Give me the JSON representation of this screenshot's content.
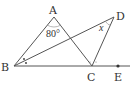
{
  "diagram": {
    "type": "geometry",
    "points": {
      "A": {
        "label": "A",
        "x": 54,
        "y": 17
      },
      "B": {
        "label": "B",
        "x": 14,
        "y": 66
      },
      "C": {
        "label": "C",
        "x": 92,
        "y": 66
      },
      "D": {
        "label": "D",
        "x": 114,
        "y": 17
      },
      "E": {
        "label": "E",
        "x": 118,
        "y": 66
      }
    },
    "angle_labels": {
      "A": "80°",
      "D": "x"
    },
    "colors": {
      "line": "#555555",
      "text": "#333333"
    }
  }
}
